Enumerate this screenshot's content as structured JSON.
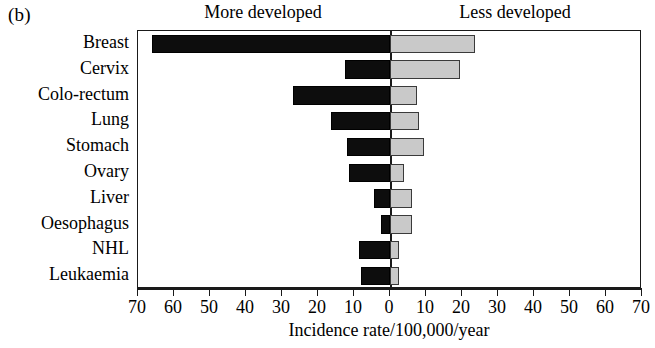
{
  "panel_label": "(b)",
  "headers": {
    "left": "More developed",
    "right": "Less developed"
  },
  "axis": {
    "xlabel": "Incidence rate/100,000/year",
    "ticks": [
      "70",
      "60",
      "50",
      "40",
      "30",
      "20",
      "10",
      "0",
      "10",
      "20",
      "30",
      "40",
      "50",
      "60",
      "70"
    ]
  },
  "colors": {
    "more_developed": "#0d0d0d",
    "less_developed": "#c9c9c9",
    "axis": "#1a1a1a"
  },
  "chart_data": {
    "type": "bar",
    "orientation": "horizontal-diverging",
    "title": "(b)",
    "xlabel": "Incidence rate/100,000/year",
    "ylabel": "",
    "xlim": [
      -70,
      70
    ],
    "xticks": [
      70,
      60,
      50,
      40,
      30,
      20,
      10,
      0,
      10,
      20,
      30,
      40,
      50,
      60,
      70
    ],
    "grid": false,
    "legend_position": "top",
    "categories": [
      "Breast",
      "Cervix",
      "Colo-rectum",
      "Lung",
      "Stomach",
      "Ovary",
      "Liver",
      "Oesophagus",
      "NHL",
      "Leukaemia"
    ],
    "series": [
      {
        "name": "More developed",
        "side": "left",
        "color": "#0d0d0d",
        "values": [
          66,
          12.5,
          27,
          16.5,
          12,
          11.5,
          4.5,
          2.5,
          8.5,
          8
        ]
      },
      {
        "name": "Less developed",
        "side": "right",
        "color": "#c9c9c9",
        "values": [
          23.5,
          19.5,
          7.5,
          8,
          9.5,
          4,
          6,
          6,
          2.5,
          2.5
        ]
      }
    ]
  }
}
